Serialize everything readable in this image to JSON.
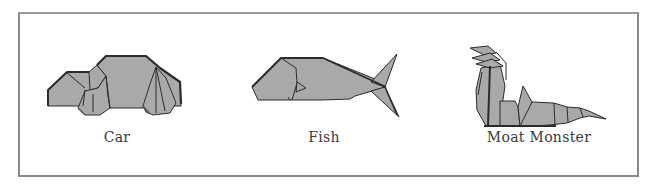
{
  "figure": {
    "items": [
      {
        "label": "Car",
        "shape": "origami-car"
      },
      {
        "label": "Fish",
        "shape": "origami-fish"
      },
      {
        "label": "Moat Monster",
        "shape": "origami-moat-monster"
      }
    ]
  },
  "colors": {
    "paper_fill": "#a9a9a9",
    "fold_line": "#2b2b2b",
    "frame_border": "#8a8a8a",
    "label_text": "#3a3a3a"
  }
}
